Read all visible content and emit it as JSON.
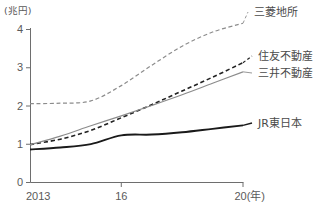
{
  "chart_data": {
    "type": "line",
    "title": "",
    "subtitle": "",
    "xlabel": "(年)",
    "ylabel": "(兆円)",
    "unit_label": "(兆円)",
    "x_axis_suffix": "20(年)",
    "xlim": [
      2013,
      2020
    ],
    "ylim": [
      0,
      4
    ],
    "grid": false,
    "legend_position": "right-inline",
    "x_tick_labels": [
      "2013",
      "16",
      "20(年)"
    ],
    "x_tick_values": [
      2013,
      2016,
      2020
    ],
    "y_tick_labels": [
      "0",
      "1",
      "2",
      "3",
      "4"
    ],
    "y_tick_values": [
      0,
      1,
      2,
      3,
      4
    ],
    "x": [
      2013,
      2014,
      2015,
      2016,
      2017,
      2018,
      2019,
      2020
    ],
    "series": [
      {
        "name": "三菱地所",
        "label": "三菱地所",
        "style": "dashed",
        "color": "#8c8c8c",
        "width": 1.2,
        "values": [
          2.05,
          2.06,
          2.12,
          2.52,
          3.05,
          3.55,
          3.92,
          4.15
        ],
        "label_x": 254,
        "label_y": 16
      },
      {
        "name": "住友不動産",
        "label": "住友不動産",
        "style": "dashed",
        "color": "#222222",
        "width": 1.6,
        "values": [
          0.98,
          1.12,
          1.35,
          1.68,
          2.02,
          2.38,
          2.74,
          3.12
        ],
        "label_x": 258,
        "label_y": 60
      },
      {
        "name": "三井不動産",
        "label": "三井不動産",
        "style": "solid",
        "color": "#8c8c8c",
        "width": 1.2,
        "values": [
          0.97,
          1.2,
          1.47,
          1.73,
          2.0,
          2.28,
          2.58,
          2.88
        ],
        "label_x": 258,
        "label_y": 77
      },
      {
        "name": "JR東日本",
        "label": "JR東日本",
        "style": "solid",
        "color": "#1a1a1a",
        "width": 1.9,
        "values": [
          0.85,
          0.9,
          0.99,
          1.22,
          1.24,
          1.3,
          1.39,
          1.48
        ],
        "label_x": 258,
        "label_y": 127
      }
    ],
    "colors": {
      "axis": "#6e6e6e",
      "text": "#5a5a5a",
      "background": "#ffffff",
      "mitsubishi": "#8c8c8c",
      "sumitomo": "#222222",
      "mitsui": "#8c8c8c",
      "jr_east": "#1a1a1a"
    },
    "plot_geometry": {
      "x_origin_px": 30,
      "x_end_px": 243,
      "y_zero_px": 182,
      "y_top_px": 29
    }
  }
}
